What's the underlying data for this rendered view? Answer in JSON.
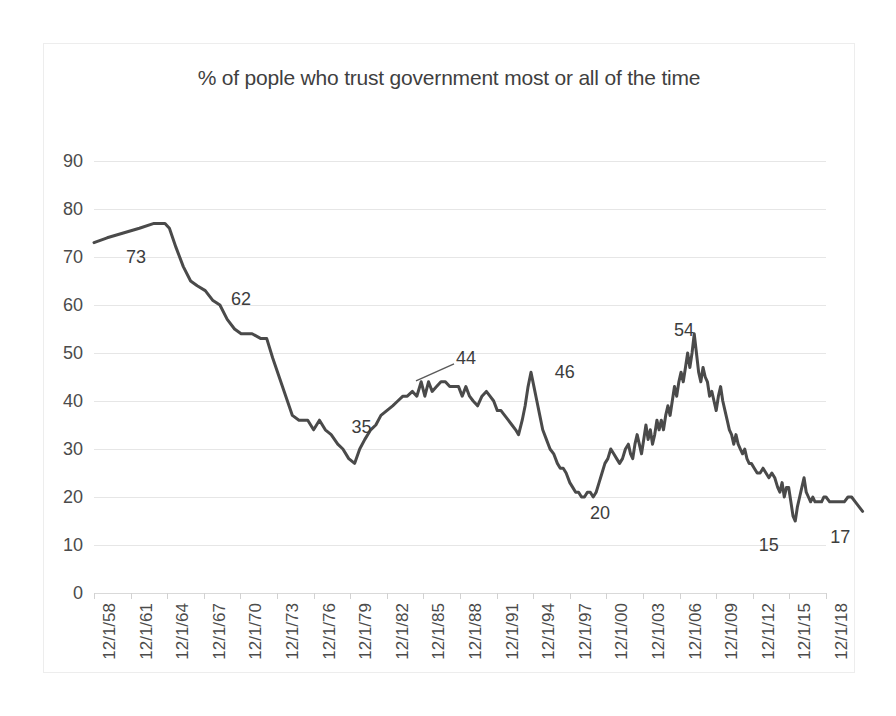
{
  "chart_data": {
    "type": "line",
    "title": "% of pople who trust government most or all of the time",
    "xlabel": "",
    "ylabel": "",
    "ylim": [
      0,
      90
    ],
    "ytick_values": [
      0,
      10,
      20,
      30,
      40,
      50,
      60,
      70,
      80,
      90
    ],
    "ytick_labels": [
      "0",
      "10",
      "20",
      "30",
      "40",
      "50",
      "60",
      "70",
      "80",
      "90"
    ],
    "grid": true,
    "legend": "none",
    "line_color": "#4a4a4a",
    "categories": [
      "12/1/58",
      "12/1/61",
      "12/1/64",
      "12/1/67",
      "12/1/70",
      "12/1/73",
      "12/1/76",
      "12/1/79",
      "12/1/82",
      "12/1/85",
      "12/1/88",
      "12/1/91",
      "12/1/94",
      "12/1/97",
      "12/1/00",
      "12/1/03",
      "12/1/06",
      "12/1/09",
      "12/1/12",
      "12/1/15",
      "12/1/18"
    ],
    "annotations": [
      {
        "label": "73",
        "x_frac": 0.03,
        "y_value": 73
      },
      {
        "label": "62",
        "x_frac": 0.168,
        "y_value": 62
      },
      {
        "label": "35",
        "x_frac": 0.33,
        "y_value": 35
      },
      {
        "label": "44",
        "x_frac": 0.47,
        "y_value": 44
      },
      {
        "label": "46",
        "x_frac": 0.605,
        "y_value": 46
      },
      {
        "label": "20",
        "x_frac": 0.653,
        "y_value": 20
      },
      {
        "label": "54",
        "x_frac": 0.765,
        "y_value": 54
      },
      {
        "label": "15",
        "x_frac": 0.9,
        "y_value": 15
      },
      {
        "label": "17",
        "x_frac": 0.995,
        "y_value": 17
      }
    ],
    "series": [
      {
        "name": "Trust in government",
        "points": [
          [
            0.0,
            73
          ],
          [
            0.018,
            74
          ],
          [
            0.04,
            75
          ],
          [
            0.062,
            76
          ],
          [
            0.082,
            77
          ],
          [
            0.097,
            77
          ],
          [
            0.103,
            76
          ],
          [
            0.112,
            72
          ],
          [
            0.122,
            68
          ],
          [
            0.132,
            65
          ],
          [
            0.141,
            64
          ],
          [
            0.152,
            63
          ],
          [
            0.162,
            61
          ],
          [
            0.172,
            60
          ],
          [
            0.182,
            57
          ],
          [
            0.192,
            55
          ],
          [
            0.201,
            54
          ],
          [
            0.216,
            54
          ],
          [
            0.228,
            53
          ],
          [
            0.236,
            53
          ],
          [
            0.244,
            49
          ],
          [
            0.253,
            45
          ],
          [
            0.262,
            41
          ],
          [
            0.271,
            37
          ],
          [
            0.28,
            36
          ],
          [
            0.292,
            36
          ],
          [
            0.3,
            34
          ],
          [
            0.308,
            36
          ],
          [
            0.316,
            34
          ],
          [
            0.324,
            33
          ],
          [
            0.333,
            31
          ],
          [
            0.34,
            30
          ],
          [
            0.348,
            28
          ],
          [
            0.356,
            27
          ],
          [
            0.363,
            30
          ],
          [
            0.37,
            32
          ],
          [
            0.378,
            34
          ],
          [
            0.385,
            35
          ],
          [
            0.392,
            37
          ],
          [
            0.4,
            38
          ],
          [
            0.408,
            39
          ],
          [
            0.415,
            40
          ],
          [
            0.422,
            41
          ],
          [
            0.428,
            41
          ],
          [
            0.435,
            42
          ],
          [
            0.441,
            41
          ],
          [
            0.447,
            44
          ],
          [
            0.452,
            41
          ],
          [
            0.457,
            44
          ],
          [
            0.462,
            42
          ],
          [
            0.468,
            43
          ],
          [
            0.474,
            44
          ],
          [
            0.48,
            44
          ],
          [
            0.486,
            43
          ],
          [
            0.492,
            43
          ],
          [
            0.498,
            43
          ],
          [
            0.503,
            41
          ],
          [
            0.508,
            43
          ],
          [
            0.513,
            41
          ],
          [
            0.518,
            40
          ],
          [
            0.524,
            39
          ],
          [
            0.53,
            41
          ],
          [
            0.536,
            42
          ],
          [
            0.541,
            41
          ],
          [
            0.546,
            40
          ],
          [
            0.551,
            38
          ],
          [
            0.556,
            38
          ],
          [
            0.561,
            37
          ],
          [
            0.566,
            36
          ],
          [
            0.571,
            35
          ],
          [
            0.576,
            34
          ],
          [
            0.58,
            33
          ],
          [
            0.585,
            36
          ],
          [
            0.589,
            39
          ],
          [
            0.593,
            43
          ],
          [
            0.597,
            46
          ],
          [
            0.601,
            43
          ],
          [
            0.605,
            40
          ],
          [
            0.609,
            37
          ],
          [
            0.613,
            34
          ],
          [
            0.618,
            32
          ],
          [
            0.623,
            30
          ],
          [
            0.628,
            29
          ],
          [
            0.633,
            27
          ],
          [
            0.637,
            26
          ],
          [
            0.641,
            26
          ],
          [
            0.645,
            25
          ],
          [
            0.65,
            23
          ],
          [
            0.654,
            22
          ],
          [
            0.658,
            21
          ],
          [
            0.662,
            21
          ],
          [
            0.666,
            20
          ],
          [
            0.67,
            20
          ],
          [
            0.674,
            21
          ],
          [
            0.678,
            21
          ],
          [
            0.682,
            20
          ],
          [
            0.686,
            21
          ],
          [
            0.69,
            23
          ],
          [
            0.694,
            25
          ],
          [
            0.698,
            27
          ],
          [
            0.702,
            28
          ],
          [
            0.706,
            30
          ],
          [
            0.71,
            29
          ],
          [
            0.714,
            28
          ],
          [
            0.718,
            27
          ],
          [
            0.722,
            28
          ],
          [
            0.726,
            30
          ],
          [
            0.73,
            31
          ],
          [
            0.733,
            29
          ],
          [
            0.736,
            28
          ],
          [
            0.739,
            31
          ],
          [
            0.742,
            33
          ],
          [
            0.745,
            31
          ],
          [
            0.748,
            29
          ],
          [
            0.751,
            32
          ],
          [
            0.754,
            35
          ],
          [
            0.757,
            32
          ],
          [
            0.76,
            34
          ],
          [
            0.763,
            31
          ],
          [
            0.766,
            33
          ],
          [
            0.769,
            36
          ],
          [
            0.772,
            34
          ],
          [
            0.775,
            36
          ],
          [
            0.778,
            34
          ],
          [
            0.781,
            37
          ],
          [
            0.784,
            39
          ],
          [
            0.787,
            37
          ],
          [
            0.79,
            40
          ],
          [
            0.793,
            43
          ],
          [
            0.796,
            41
          ],
          [
            0.799,
            44
          ],
          [
            0.802,
            46
          ],
          [
            0.805,
            44
          ],
          [
            0.808,
            47
          ],
          [
            0.811,
            50
          ],
          [
            0.814,
            47
          ],
          [
            0.817,
            50
          ],
          [
            0.82,
            54
          ],
          [
            0.823,
            50
          ],
          [
            0.826,
            46
          ],
          [
            0.829,
            44
          ],
          [
            0.832,
            47
          ],
          [
            0.835,
            45
          ],
          [
            0.838,
            44
          ],
          [
            0.841,
            41
          ],
          [
            0.844,
            42
          ],
          [
            0.847,
            40
          ],
          [
            0.85,
            38
          ],
          [
            0.853,
            41
          ],
          [
            0.856,
            43
          ],
          [
            0.859,
            40
          ],
          [
            0.862,
            38
          ],
          [
            0.865,
            36
          ],
          [
            0.868,
            34
          ],
          [
            0.871,
            33
          ],
          [
            0.874,
            31
          ],
          [
            0.877,
            33
          ],
          [
            0.88,
            31
          ],
          [
            0.883,
            30
          ],
          [
            0.886,
            29
          ],
          [
            0.889,
            30
          ],
          [
            0.892,
            28
          ],
          [
            0.895,
            27
          ],
          [
            0.898,
            27
          ],
          [
            0.902,
            26
          ],
          [
            0.906,
            25
          ],
          [
            0.91,
            25
          ],
          [
            0.914,
            26
          ],
          [
            0.918,
            25
          ],
          [
            0.922,
            24
          ],
          [
            0.926,
            25
          ],
          [
            0.93,
            24
          ],
          [
            0.934,
            22
          ],
          [
            0.937,
            21
          ],
          [
            0.94,
            23
          ],
          [
            0.943,
            20
          ],
          [
            0.946,
            22
          ],
          [
            0.949,
            22
          ],
          [
            0.952,
            19
          ],
          [
            0.955,
            16
          ],
          [
            0.958,
            15
          ],
          [
            0.961,
            18
          ],
          [
            0.964,
            20
          ],
          [
            0.967,
            22
          ],
          [
            0.97,
            24
          ],
          [
            0.973,
            21
          ],
          [
            0.976,
            20
          ],
          [
            0.979,
            19
          ],
          [
            0.982,
            20
          ],
          [
            0.985,
            19
          ],
          [
            0.988,
            19
          ],
          [
            0.991,
            19
          ],
          [
            0.994,
            19
          ],
          [
            0.997,
            20
          ],
          [
            1.0,
            20
          ],
          [
            1.005,
            19
          ],
          [
            1.01,
            19
          ],
          [
            1.015,
            19
          ],
          [
            1.02,
            19
          ],
          [
            1.025,
            19
          ],
          [
            1.03,
            20
          ],
          [
            1.035,
            20
          ],
          [
            1.04,
            19
          ],
          [
            1.045,
            18
          ],
          [
            1.05,
            17
          ]
        ]
      }
    ]
  }
}
